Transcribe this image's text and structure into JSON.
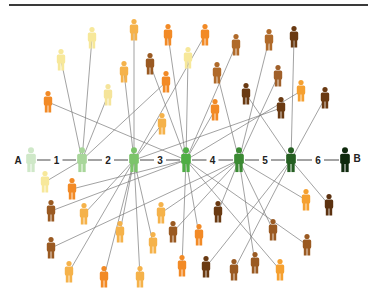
{
  "diagram": {
    "title_rule": true,
    "chain": {
      "start_label": "A",
      "end_label": "B",
      "step_labels": [
        "1",
        "2",
        "3",
        "4",
        "5",
        "6"
      ],
      "nodes": [
        {
          "id": "A",
          "x": 31,
          "y": 160,
          "color": "#cfe8c8"
        },
        {
          "id": "n1",
          "x": 82,
          "y": 160,
          "color": "#a8d69a"
        },
        {
          "id": "n2",
          "x": 134,
          "y": 160,
          "color": "#7cc46a"
        },
        {
          "id": "n3",
          "x": 186,
          "y": 160,
          "color": "#4fae45"
        },
        {
          "id": "n4",
          "x": 239,
          "y": 160,
          "color": "#3b8a33"
        },
        {
          "id": "n5",
          "x": 291,
          "y": 160,
          "color": "#255f22"
        },
        {
          "id": "B",
          "x": 345,
          "y": 160,
          "color": "#0f2a0d"
        }
      ]
    },
    "people": [
      {
        "x": 61,
        "y": 60,
        "color": "#f7e89a",
        "link": "n1"
      },
      {
        "x": 92,
        "y": 38,
        "color": "#f7e89a",
        "link": "n1"
      },
      {
        "x": 108,
        "y": 95,
        "color": "#f5e49a",
        "link": "n1"
      },
      {
        "x": 48,
        "y": 102,
        "color": "#f28a26",
        "link": "n3"
      },
      {
        "x": 134,
        "y": 30,
        "color": "#f5b24a",
        "link": "n2"
      },
      {
        "x": 124,
        "y": 72,
        "color": "#f5b24a",
        "link": "n2"
      },
      {
        "x": 150,
        "y": 64,
        "color": "#9a5a22",
        "link": "n3"
      },
      {
        "x": 166,
        "y": 82,
        "color": "#f28a26",
        "link": "n1"
      },
      {
        "x": 168,
        "y": 35,
        "color": "#f28a26",
        "link": "n3"
      },
      {
        "x": 188,
        "y": 58,
        "color": "#f7e89a",
        "link": "n3"
      },
      {
        "x": 162,
        "y": 124,
        "color": "#f5b24a",
        "link": "n2"
      },
      {
        "x": 205,
        "y": 35,
        "color": "#f28a26",
        "link": "n2"
      },
      {
        "x": 236,
        "y": 45,
        "color": "#b06a2a",
        "link": "n3"
      },
      {
        "x": 217,
        "y": 73,
        "color": "#b06a2a",
        "link": "n4"
      },
      {
        "x": 215,
        "y": 110,
        "color": "#f28a26",
        "link": "n3"
      },
      {
        "x": 246,
        "y": 94,
        "color": "#6a3a12",
        "link": "n5"
      },
      {
        "x": 269,
        "y": 40,
        "color": "#b06a2a",
        "link": "n4"
      },
      {
        "x": 278,
        "y": 76,
        "color": "#a0602a",
        "link": "n4"
      },
      {
        "x": 294,
        "y": 37,
        "color": "#6a3a12",
        "link": "n5"
      },
      {
        "x": 301,
        "y": 91,
        "color": "#f5a030",
        "link": "n3"
      },
      {
        "x": 281,
        "y": 108,
        "color": "#6a3a12",
        "link": "n2"
      },
      {
        "x": 325,
        "y": 98,
        "color": "#6a3a12",
        "link": "n5"
      },
      {
        "x": 45,
        "y": 182,
        "color": "#f7e89a",
        "link": "n1"
      },
      {
        "x": 72,
        "y": 189,
        "color": "#f28a26",
        "link": "n3"
      },
      {
        "x": 51,
        "y": 211,
        "color": "#9a5a22",
        "link": "n3"
      },
      {
        "x": 84,
        "y": 214,
        "color": "#f5b24a",
        "link": "n2"
      },
      {
        "x": 51,
        "y": 248,
        "color": "#9a5a22",
        "link": "n4"
      },
      {
        "x": 120,
        "y": 232,
        "color": "#f5b24a",
        "link": "n2"
      },
      {
        "x": 69,
        "y": 272,
        "color": "#f5b24a",
        "link": "n2"
      },
      {
        "x": 104,
        "y": 277,
        "color": "#f28a26",
        "link": "n2"
      },
      {
        "x": 140,
        "y": 277,
        "color": "#f5b24a",
        "link": "n2"
      },
      {
        "x": 161,
        "y": 213,
        "color": "#f5b24a",
        "link": "n4"
      },
      {
        "x": 153,
        "y": 243,
        "color": "#f5b24a",
        "link": "n2"
      },
      {
        "x": 173,
        "y": 232,
        "color": "#9a5a22",
        "link": "n4"
      },
      {
        "x": 182,
        "y": 266,
        "color": "#f28a26",
        "link": "n3"
      },
      {
        "x": 199,
        "y": 235,
        "color": "#f28a26",
        "link": "n3"
      },
      {
        "x": 218,
        "y": 212,
        "color": "#6a3a12",
        "link": "n4"
      },
      {
        "x": 206,
        "y": 267,
        "color": "#6a3a12",
        "link": "n5"
      },
      {
        "x": 234,
        "y": 270,
        "color": "#9a5a22",
        "link": "n5"
      },
      {
        "x": 255,
        "y": 263,
        "color": "#9a5a22",
        "link": "n4"
      },
      {
        "x": 273,
        "y": 230,
        "color": "#9a5a22",
        "link": "n4"
      },
      {
        "x": 280,
        "y": 270,
        "color": "#f5a030",
        "link": "n3"
      },
      {
        "x": 306,
        "y": 200,
        "color": "#f5a030",
        "link": "n4"
      },
      {
        "x": 329,
        "y": 205,
        "color": "#5c3210",
        "link": "n5"
      },
      {
        "x": 307,
        "y": 245,
        "color": "#9a5a22",
        "link": "n3"
      }
    ],
    "line_color": "#7a7a7a"
  }
}
